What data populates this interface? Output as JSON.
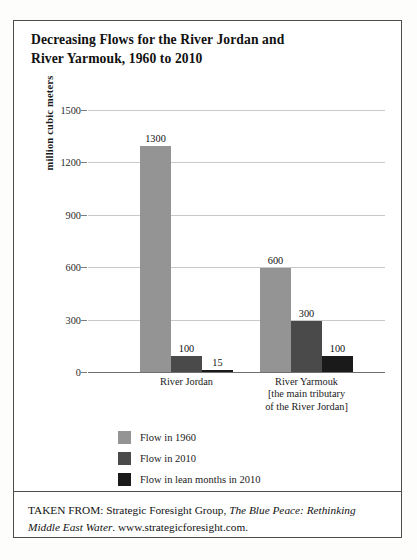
{
  "figure": {
    "title_line1": "Decreasing Flows for the River Jordan and",
    "title_line2": "River Yarmouk, 1960 to 2010",
    "source_prefix": "TAKEN FROM: Strategic Foresight Group, ",
    "source_italic1": "The Blue Peace:",
    "source_italic2": "Rethinking Middle East Water",
    "source_suffix": ". www.strategicforesight.com."
  },
  "chart_data": {
    "type": "bar",
    "title": "Decreasing Flows for the River Jordan and River Yarmouk, 1960 to 2010",
    "xlabel": "",
    "ylabel": "million cubic meters",
    "ylim": [
      0,
      1500
    ],
    "yticks": [
      "0",
      "300",
      "600",
      "900",
      "1200",
      "1500"
    ],
    "grid": true,
    "legend_position": "bottom-left",
    "categories": [
      "River Jordan",
      "River Yarmouk\n[the main tributary\nof the River Jordan]"
    ],
    "category_labels": [
      {
        "line1": "River Jordan",
        "line2": "",
        "line3": ""
      },
      {
        "line1": "River Yarmouk",
        "line2": "[the main tributary",
        "line3": "of the River Jordan]"
      }
    ],
    "series": [
      {
        "name": "Flow in 1960",
        "color": "#949494",
        "values": [
          1300,
          600
        ]
      },
      {
        "name": "Flow in 2010",
        "color": "#4a4a4a",
        "values": [
          100,
          300
        ]
      },
      {
        "name": "Flow in lean months in 2010",
        "color": "#1a1a1a",
        "values": [
          15,
          100
        ]
      }
    ],
    "data_labels": [
      [
        "1300",
        "100",
        "15"
      ],
      [
        "600",
        "300",
        "100"
      ]
    ]
  },
  "colors": {
    "series1": "#949494",
    "series2": "#4a4a4a",
    "series3": "#1a1a1a",
    "grid": "#c9c9c9",
    "axis": "#6f6f6f",
    "border": "#4c4c4c"
  }
}
